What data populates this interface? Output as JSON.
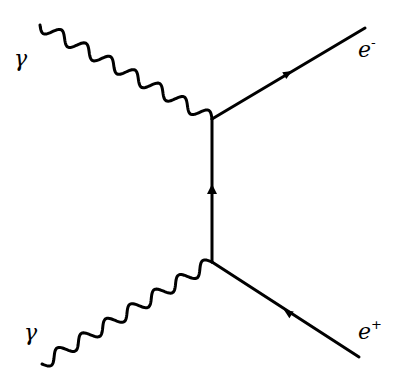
{
  "diagram": {
    "type": "feynman",
    "process": "pair production (γγ → e⁻e⁺)",
    "stroke_color": "#000000",
    "background": "#ffffff",
    "vertices": [
      {
        "id": "v_top",
        "x": 212,
        "y": 119
      },
      {
        "id": "v_bottom",
        "x": 212,
        "y": 262
      }
    ],
    "edges": [
      {
        "name": "photon-upper",
        "kind": "photon",
        "from": [
          40,
          25
        ],
        "to": [
          212,
          119
        ],
        "wiggles": 7
      },
      {
        "name": "photon-lower",
        "kind": "photon",
        "from": [
          42,
          364
        ],
        "to": [
          212,
          262
        ],
        "wiggles": 7
      },
      {
        "name": "electron-out",
        "kind": "fermion",
        "from": [
          212,
          119
        ],
        "to": [
          365,
          28
        ],
        "arrow": "forward"
      },
      {
        "name": "positron-out",
        "kind": "fermion",
        "from": [
          359,
          357
        ],
        "to": [
          212,
          262
        ],
        "arrow": "forward"
      },
      {
        "name": "propagator",
        "kind": "fermion",
        "from": [
          212,
          262
        ],
        "to": [
          212,
          119
        ],
        "arrow": "forward"
      }
    ],
    "labels": {
      "photon_upper": {
        "base": "γ",
        "sup": ""
      },
      "photon_lower": {
        "base": "γ",
        "sup": ""
      },
      "electron": {
        "base": "e",
        "sup": "-"
      },
      "positron": {
        "base": "e",
        "sup": "+"
      }
    }
  }
}
